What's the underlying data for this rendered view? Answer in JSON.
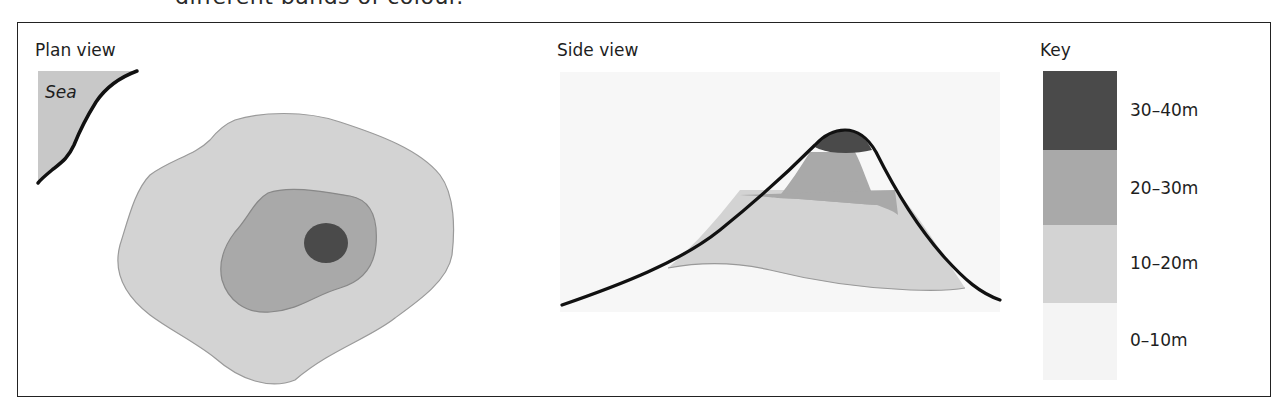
{
  "heading_fragment": "different bands of colour.",
  "panels": {
    "plan": {
      "title": "Plan view",
      "sea_label": "Sea"
    },
    "side": {
      "title": "Side view"
    },
    "key": {
      "title": "Key",
      "items": [
        {
          "label": "30–40m",
          "color": "#4a4a4a"
        },
        {
          "label": "20–30m",
          "color": "#a9a9a9"
        },
        {
          "label": "10–20m",
          "color": "#d3d3d3"
        },
        {
          "label": "0–10m",
          "color": "#f4f4f4"
        }
      ]
    }
  },
  "colors": {
    "band_30_40": "#4a4a4a",
    "band_20_30": "#a9a9a9",
    "band_10_20": "#d3d3d3",
    "band_0_10": "#f4f4f4",
    "sea": "#c8c8c8",
    "outline": "#111111"
  }
}
